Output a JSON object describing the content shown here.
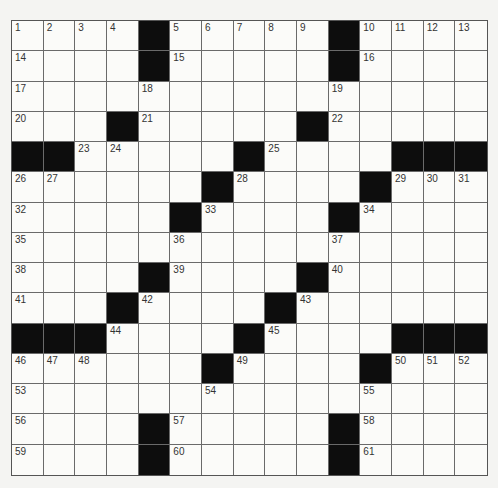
{
  "puzzle": {
    "rows": 15,
    "cols": 15,
    "colors": {
      "block": "#0d0d0d",
      "cell": "#fbfbf9",
      "gridline": "#6a6a6a",
      "number": "#333333",
      "background": "#f4f4f2"
    },
    "layout": [
      "....#.....#....",
      "....#.....#....",
      "...............",
      "...#.....#.....",
      "##.....#....###",
      "......#....#...",
      ".....#....#....",
      "...............",
      "....#....#.....",
      "...#....#......",
      "###....#....###",
      "......#....#...",
      "...............",
      "....#.....#....",
      "....#.....#...."
    ],
    "numbers": [
      {
        "r": 0,
        "c": 0,
        "n": "1"
      },
      {
        "r": 0,
        "c": 1,
        "n": "2"
      },
      {
        "r": 0,
        "c": 2,
        "n": "3"
      },
      {
        "r": 0,
        "c": 3,
        "n": "4"
      },
      {
        "r": 0,
        "c": 5,
        "n": "5"
      },
      {
        "r": 0,
        "c": 6,
        "n": "6"
      },
      {
        "r": 0,
        "c": 7,
        "n": "7"
      },
      {
        "r": 0,
        "c": 8,
        "n": "8"
      },
      {
        "r": 0,
        "c": 9,
        "n": "9"
      },
      {
        "r": 0,
        "c": 11,
        "n": "10"
      },
      {
        "r": 0,
        "c": 12,
        "n": "11"
      },
      {
        "r": 0,
        "c": 13,
        "n": "12"
      },
      {
        "r": 0,
        "c": 14,
        "n": "13"
      },
      {
        "r": 1,
        "c": 0,
        "n": "14"
      },
      {
        "r": 1,
        "c": 5,
        "n": "15"
      },
      {
        "r": 1,
        "c": 11,
        "n": "16"
      },
      {
        "r": 2,
        "c": 0,
        "n": "17"
      },
      {
        "r": 2,
        "c": 4,
        "n": "18"
      },
      {
        "r": 2,
        "c": 10,
        "n": "19"
      },
      {
        "r": 3,
        "c": 0,
        "n": "20"
      },
      {
        "r": 3,
        "c": 4,
        "n": "21"
      },
      {
        "r": 3,
        "c": 10,
        "n": "22"
      },
      {
        "r": 4,
        "c": 2,
        "n": "23"
      },
      {
        "r": 4,
        "c": 3,
        "n": "24"
      },
      {
        "r": 4,
        "c": 8,
        "n": "25"
      },
      {
        "r": 5,
        "c": 0,
        "n": "26"
      },
      {
        "r": 5,
        "c": 1,
        "n": "27"
      },
      {
        "r": 5,
        "c": 7,
        "n": "28"
      },
      {
        "r": 5,
        "c": 12,
        "n": "29"
      },
      {
        "r": 5,
        "c": 13,
        "n": "30"
      },
      {
        "r": 5,
        "c": 14,
        "n": "31"
      },
      {
        "r": 6,
        "c": 0,
        "n": "32"
      },
      {
        "r": 6,
        "c": 6,
        "n": "33"
      },
      {
        "r": 6,
        "c": 11,
        "n": "34"
      },
      {
        "r": 7,
        "c": 0,
        "n": "35"
      },
      {
        "r": 7,
        "c": 5,
        "n": "36"
      },
      {
        "r": 7,
        "c": 10,
        "n": "37"
      },
      {
        "r": 8,
        "c": 0,
        "n": "38"
      },
      {
        "r": 8,
        "c": 5,
        "n": "39"
      },
      {
        "r": 8,
        "c": 10,
        "n": "40"
      },
      {
        "r": 9,
        "c": 0,
        "n": "41"
      },
      {
        "r": 9,
        "c": 4,
        "n": "42"
      },
      {
        "r": 9,
        "c": 9,
        "n": "43"
      },
      {
        "r": 10,
        "c": 3,
        "n": "44"
      },
      {
        "r": 10,
        "c": 8,
        "n": "45"
      },
      {
        "r": 11,
        "c": 0,
        "n": "46"
      },
      {
        "r": 11,
        "c": 1,
        "n": "47"
      },
      {
        "r": 11,
        "c": 2,
        "n": "48"
      },
      {
        "r": 11,
        "c": 7,
        "n": "49"
      },
      {
        "r": 11,
        "c": 12,
        "n": "50"
      },
      {
        "r": 11,
        "c": 13,
        "n": "51"
      },
      {
        "r": 11,
        "c": 14,
        "n": "52"
      },
      {
        "r": 12,
        "c": 0,
        "n": "53"
      },
      {
        "r": 12,
        "c": 6,
        "n": "54"
      },
      {
        "r": 12,
        "c": 11,
        "n": "55"
      },
      {
        "r": 13,
        "c": 0,
        "n": "56"
      },
      {
        "r": 13,
        "c": 5,
        "n": "57"
      },
      {
        "r": 13,
        "c": 11,
        "n": "58"
      },
      {
        "r": 14,
        "c": 0,
        "n": "59"
      },
      {
        "r": 14,
        "c": 5,
        "n": "60"
      },
      {
        "r": 14,
        "c": 11,
        "n": "61"
      }
    ],
    "fills": []
  }
}
